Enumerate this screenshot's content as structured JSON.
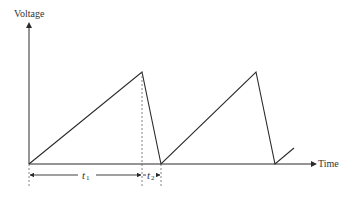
{
  "diagram": {
    "type": "sawtooth-waveform",
    "y_axis_label": "Voltage",
    "x_axis_label": "Time",
    "intervals": [
      {
        "name": "t1",
        "symbol": "t",
        "subscript": "1",
        "description": "rise time"
      },
      {
        "name": "t2",
        "symbol": "t",
        "subscript": "2",
        "description": "fall time"
      }
    ],
    "waveform_points": [
      [
        29,
        164
      ],
      [
        142,
        72
      ],
      [
        161,
        164
      ],
      [
        256,
        72
      ],
      [
        275,
        164
      ],
      [
        294,
        148
      ]
    ],
    "colors": {
      "line": "#2a2a2a",
      "dashed": "#666666",
      "text": "#333333"
    }
  }
}
